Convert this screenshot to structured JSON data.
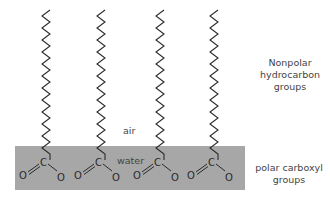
{
  "diagram": {
    "regions": {
      "air_label": "air",
      "water_label": "water",
      "water_layer_color": "#a7a7a7"
    },
    "annotations": {
      "nonpolar": {
        "lines": [
          "Nonpolar",
          "hydrocarbon",
          "groups"
        ]
      },
      "polar": {
        "lines": [
          "polar carboxyl",
          "groups"
        ]
      }
    },
    "molecules": [
      {
        "id": 1,
        "carbon_label": "C",
        "left_oxygen": "O",
        "right_oxygen": "O",
        "x": 45
      },
      {
        "id": 2,
        "carbon_label": "C",
        "left_oxygen": "O",
        "right_oxygen": "O",
        "x": 100
      },
      {
        "id": 3,
        "carbon_label": "C",
        "left_oxygen": "O",
        "right_oxygen": "O",
        "x": 155
      },
      {
        "id": 4,
        "carbon_label": "C",
        "left_oxygen": "O",
        "right_oxygen": "O",
        "x": 210
      }
    ]
  }
}
